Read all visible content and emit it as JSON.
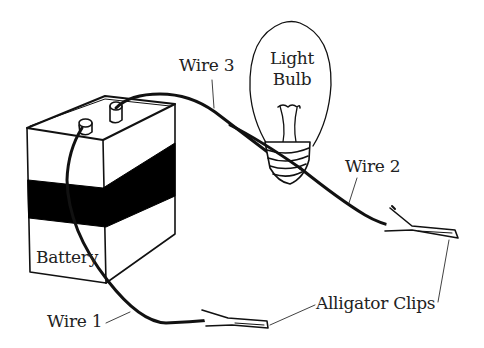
{
  "diagram": {
    "labels": {
      "wire3": "Wire 3",
      "light_line1": "Light",
      "light_line2": "Bulb",
      "wire2": "Wire 2",
      "battery": "Battery",
      "wire1": "Wire 1",
      "alligator_clips": "Alligator Clips"
    },
    "components": [
      "battery",
      "light-bulb",
      "wire-1",
      "wire-2",
      "wire-3",
      "alligator-clip-1",
      "alligator-clip-2"
    ],
    "colors": {
      "ink": "#111111",
      "fill": "#000000",
      "background": "#ffffff"
    }
  }
}
